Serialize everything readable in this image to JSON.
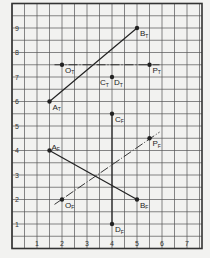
{
  "grid": {
    "x_ticks": [
      "1",
      "2",
      "3",
      "4",
      "5",
      "6",
      "7"
    ],
    "y_ticks": [
      "1",
      "2",
      "3",
      "4",
      "5",
      "6",
      "7",
      "8",
      "9"
    ],
    "x_range": [
      0,
      7.6
    ],
    "y_range": [
      0,
      10
    ],
    "minor_step": 0.5
  },
  "points": [
    {
      "id": "AT",
      "letter": "A",
      "sub": "T",
      "x": 1.5,
      "y": 6,
      "label_dx": 3,
      "label_dy": 8
    },
    {
      "id": "BT",
      "letter": "B",
      "sub": "T",
      "x": 5,
      "y": 9,
      "label_dx": 3,
      "label_dy": 8
    },
    {
      "id": "OT",
      "letter": "O",
      "sub": "T",
      "x": 2,
      "y": 7.5,
      "label_dx": 3,
      "label_dy": 8
    },
    {
      "id": "PT",
      "letter": "P",
      "sub": "T",
      "x": 5.5,
      "y": 7.5,
      "label_dx": 3,
      "label_dy": 8
    },
    {
      "id": "CTDT",
      "letter": "C",
      "sub": "T",
      "x": 4,
      "y": 7,
      "label_dx": -12,
      "label_dy": 8
    },
    {
      "id": "AF",
      "letter": "A",
      "sub": "F",
      "x": 1.5,
      "y": 4,
      "label_dx": 2,
      "label_dy": -1
    },
    {
      "id": "BF",
      "letter": "B",
      "sub": "F",
      "x": 5,
      "y": 2,
      "label_dx": 3,
      "label_dy": 8
    },
    {
      "id": "OF",
      "letter": "O",
      "sub": "F",
      "x": 2,
      "y": 2,
      "label_dx": 3,
      "label_dy": 8
    },
    {
      "id": "PF",
      "letter": "P",
      "sub": "F",
      "x": 5.5,
      "y": 4.5,
      "label_dx": 3,
      "label_dy": 8
    },
    {
      "id": "CF",
      "letter": "C",
      "sub": "F",
      "x": 4,
      "y": 5.5,
      "label_dx": 3,
      "label_dy": 8
    },
    {
      "id": "DF",
      "letter": "D",
      "sub": "F",
      "x": 4,
      "y": 1,
      "label_dx": 3,
      "label_dy": 8
    }
  ],
  "extra_labels": [
    {
      "letter": "D",
      "sub": "T",
      "x": 4,
      "y": 7,
      "label_dx": 2,
      "label_dy": 8
    }
  ],
  "lines": [
    {
      "name": "line-AT-BT",
      "x1": 1.5,
      "y1": 6,
      "x2": 5,
      "y2": 9,
      "style": "solid"
    },
    {
      "name": "line-OT-PT",
      "x1": 1.7,
      "y1": 7.5,
      "x2": 5.9,
      "y2": 7.5,
      "style": "dashdot"
    },
    {
      "name": "line-AF-BF",
      "x1": 1.5,
      "y1": 4,
      "x2": 5,
      "y2": 2,
      "style": "solid"
    },
    {
      "name": "line-OF-PF",
      "x1": 1.7,
      "y1": 1.8,
      "x2": 5.9,
      "y2": 4.75,
      "style": "dashdot"
    },
    {
      "name": "line-CF-DF",
      "x1": 4,
      "y1": 5.5,
      "x2": 4,
      "y2": 1,
      "style": "solid"
    }
  ],
  "colors": {
    "ink": "#222222",
    "grid": "#555555",
    "paper": "#f2f2f0"
  }
}
